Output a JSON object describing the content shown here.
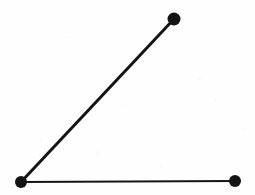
{
  "figure": {
    "name": "angle-diagram",
    "background_color": "#fefefe",
    "stroke_color": "#141414",
    "dot_color": "#131313",
    "canvas": {
      "width": 255,
      "height": 195
    }
  },
  "chart_data": {
    "type": "diagram",
    "title": "",
    "xlabel": "",
    "ylabel": "",
    "points": [
      {
        "id": "vertex",
        "label": "",
        "x": 21,
        "y": 182,
        "radius": 6
      },
      {
        "id": "upper-endpoint",
        "label": "",
        "x": 174,
        "y": 19,
        "radius": 6.5
      },
      {
        "id": "right-endpoint",
        "label": "",
        "x": 235,
        "y": 181,
        "radius": 6
      }
    ],
    "segments": [
      {
        "id": "diagonal-ray",
        "from": "vertex",
        "to": "upper-endpoint",
        "thickness": 3.0
      },
      {
        "id": "horizontal-ray",
        "from": "vertex",
        "to": "right-endpoint",
        "thickness": 2.2
      }
    ],
    "angle_degrees": 47,
    "legend": [],
    "grid": false
  },
  "specks": [
    {
      "x": 40,
      "y": 138,
      "size": 3,
      "opacity": 0.55
    },
    {
      "x": 96,
      "y": 151,
      "size": 4,
      "opacity": 0.45
    },
    {
      "x": 198,
      "y": 77,
      "size": 3,
      "opacity": 0.5
    },
    {
      "x": 214,
      "y": 99,
      "size": 3,
      "opacity": 0.4
    },
    {
      "x": 122,
      "y": 104,
      "size": 2,
      "opacity": 0.5
    },
    {
      "x": 66,
      "y": 36,
      "size": 2,
      "opacity": 0.45
    },
    {
      "x": 160,
      "y": 164,
      "size": 3,
      "opacity": 0.4
    },
    {
      "x": 243,
      "y": 128,
      "size": 2,
      "opacity": 0.5
    }
  ]
}
